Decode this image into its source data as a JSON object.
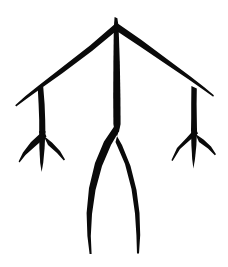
{
  "canvas": {
    "width": 228,
    "height": 267,
    "background_color": "#ffffff",
    "ink_color": "#0a0a0a",
    "title": "Brush-drawn branching stick figure ideogram",
    "description": "A symmetric hand-inked glyph: a central vertical stem rising to an apex, two diagonal arms sloping down to the left and right, each terminating in a short vertical branch that ends in a three-pronged foot, while the central stem forks into two long outward-bowed tapering legs."
  },
  "figure": {
    "name": "branching-stick-figure",
    "stroke_style": "brush-ink",
    "symmetry": "bilateral",
    "parts": [
      {
        "id": "apex-stem",
        "label": "Central vertical stem",
        "from": [
          116,
          17
        ],
        "to": [
          117,
          130
        ],
        "max_width": 7
      },
      {
        "id": "left-arm",
        "label": "Left diagonal arm",
        "from": [
          116,
          26
        ],
        "to": [
          16,
          107
        ],
        "max_width": 8
      },
      {
        "id": "right-arm",
        "label": "Right diagonal arm",
        "from": [
          116,
          26
        ],
        "to": [
          213,
          97
        ],
        "max_width": 8
      },
      {
        "id": "left-branch",
        "label": "Left vertical branch",
        "from": [
          41,
          90
        ],
        "to": [
          42,
          133
        ],
        "max_width": 6
      },
      {
        "id": "right-branch",
        "label": "Right vertical branch",
        "from": [
          194,
          88
        ],
        "to": [
          194,
          130
        ],
        "max_width": 6
      },
      {
        "id": "left-foot",
        "label": "Left three-pronged foot",
        "fork": [
          42,
          133
        ],
        "prongs": [
          [
            20,
            163
          ],
          [
            41,
            172
          ],
          [
            64,
            160
          ]
        ]
      },
      {
        "id": "right-foot",
        "label": "Right three-pronged foot",
        "fork": [
          194,
          130
        ],
        "prongs": [
          [
            172,
            162
          ],
          [
            193,
            168
          ],
          [
            215,
            155
          ]
        ]
      },
      {
        "id": "left-leg",
        "label": "Left bowed tapering leg",
        "fork": [
          117,
          130
        ],
        "tip": [
          92,
          254
        ],
        "bow": "outward"
      },
      {
        "id": "right-leg",
        "label": "Right bowed tapering leg",
        "fork": [
          117,
          130
        ],
        "tip": [
          137,
          253
        ],
        "bow": "outward"
      }
    ]
  }
}
